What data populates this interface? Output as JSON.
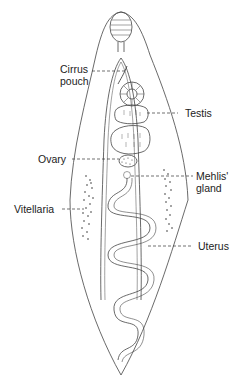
{
  "diagram": {
    "stroke_color": "#444444",
    "labels": {
      "cirrus_pouch_line1": "Cirrus",
      "cirrus_pouch_line2": "pouch",
      "testis": "Testis",
      "ovary": "Ovary",
      "mehlis_line1": "Mehlis'",
      "mehlis_line2": "gland",
      "vitellaria": "Vitellaria",
      "uterus": "Uterus"
    }
  }
}
